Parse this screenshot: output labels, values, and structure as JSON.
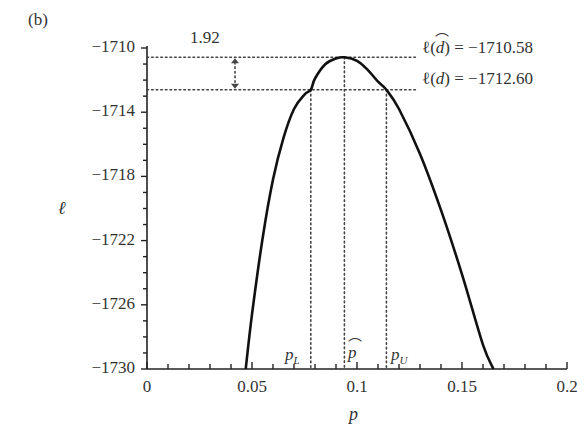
{
  "panel_label": "(b)",
  "chart_data": {
    "type": "line",
    "title": "",
    "xlabel": "p",
    "ylabel": "ℓ",
    "xlim": [
      0,
      0.2
    ],
    "ylim": [
      -1730,
      -1710
    ],
    "grid": false,
    "x_ticks": [
      0,
      0.05,
      0.1,
      0.15,
      0.2
    ],
    "x_tick_labels": [
      "0",
      "0.05",
      "0.1",
      "0.15",
      "0.2"
    ],
    "x_minor_step": 0.01,
    "y_ticks": [
      -1710,
      -1714,
      -1718,
      -1722,
      -1726,
      -1730
    ],
    "y_tick_labels": [
      "−1710",
      "−1714",
      "−1718",
      "−1722",
      "−1726",
      "−1730"
    ],
    "y_minor_step": 1,
    "series": [
      {
        "name": "profile log-likelihood",
        "x": [
          0.047,
          0.05,
          0.055,
          0.06,
          0.065,
          0.07,
          0.075,
          0.078,
          0.08,
          0.085,
          0.09,
          0.094,
          0.1,
          0.105,
          0.11,
          0.114,
          0.12,
          0.13,
          0.14,
          0.15,
          0.16,
          0.165
        ],
        "y": [
          -1730.0,
          -1726.6,
          -1721.9,
          -1718.2,
          -1715.6,
          -1713.8,
          -1712.9,
          -1712.6,
          -1711.9,
          -1711.0,
          -1710.65,
          -1710.58,
          -1710.8,
          -1711.35,
          -1712.1,
          -1712.6,
          -1713.8,
          -1716.6,
          -1720.1,
          -1724.1,
          -1728.5,
          -1730.0
        ]
      }
    ],
    "reference_lines": {
      "max_loglik": {
        "label": "ℓ(d̂) = −1710.58",
        "value": -1710.58
      },
      "cutoff_loglik": {
        "label": "ℓ(d) = −1712.60",
        "value": -1712.6
      },
      "difference": "1.92"
    },
    "vertical_markers": [
      {
        "name": "p_L",
        "label": "p",
        "sub": "L",
        "x": 0.078
      },
      {
        "name": "p_hat",
        "label": "p̂",
        "sub": "",
        "x": 0.094
      },
      {
        "name": "p_U",
        "label": "p",
        "sub": "U",
        "x": 0.114
      }
    ]
  },
  "annotations": {
    "diff_label": "1.92",
    "max_label_lhs": "ℓ(",
    "max_label_var": "d",
    "max_label_rhs": ") = −1710.58",
    "cut_label_lhs": "ℓ(",
    "cut_label_var": "d",
    "cut_label_rhs": ") = −1712.60"
  },
  "style": {
    "curve_color": "#111111",
    "axis_color": "#222222",
    "dotted_color": "#444444"
  }
}
